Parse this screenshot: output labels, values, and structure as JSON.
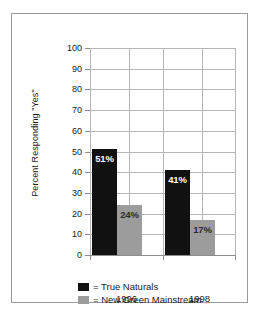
{
  "chart_data": {
    "type": "bar",
    "title": "",
    "xlabel": "",
    "ylabel": "Percent Responding \"Yes\"",
    "categories": [
      "1996",
      "1998"
    ],
    "series": [
      {
        "name": "True Naturals",
        "color": "#111111",
        "values": [
          51,
          41
        ],
        "labels": [
          "51%",
          "41%"
        ]
      },
      {
        "name": "New Green Mainstream",
        "color": "#9c9c9c",
        "values": [
          24,
          17
        ],
        "labels": [
          "24%",
          "17%"
        ]
      }
    ],
    "ylim": [
      0,
      100
    ],
    "ytick_step": 10,
    "yticks": [
      "100",
      "90",
      "80",
      "70",
      "60",
      "50",
      "40",
      "30",
      "20",
      "10",
      "0"
    ],
    "grid": true,
    "legend_position": "bottom"
  },
  "legend": {
    "rows": [
      {
        "prefix": "= ",
        "label": "= True Naturals",
        "series": "True Naturals"
      },
      {
        "prefix": "= ",
        "label": "= New Green Mainstream",
        "series": "New Green Mainstream"
      }
    ]
  },
  "axis": {
    "y_title": "Percent Responding \"Yes\"",
    "x_categories": [
      "1996",
      "1998"
    ]
  },
  "colors": {
    "true_naturals": "#111111",
    "new_green_mainstream": "#9c9c9c",
    "frame": "#9b9b9b",
    "gridline": "#b6b6b6",
    "background": "#ffffff"
  }
}
